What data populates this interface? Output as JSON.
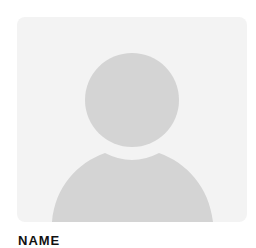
{
  "profile": {
    "avatar_icon": "default-user-avatar-icon",
    "name_label": "NAME"
  },
  "colors": {
    "card_bg": "#f3f3f3",
    "silhouette": "#d4d4d4",
    "text": "#111111"
  }
}
